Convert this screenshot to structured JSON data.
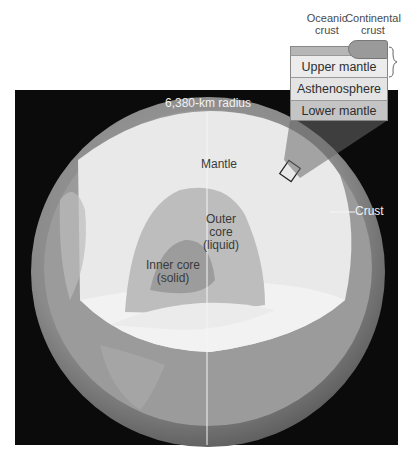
{
  "figure": {
    "radius_label": "6,380-km radius",
    "layers": {
      "mantle": "Mantle",
      "crust": "Crust",
      "outer_core": [
        "Outer",
        "core",
        "(liquid)"
      ],
      "inner_core": [
        "Inner core",
        "(solid)"
      ]
    },
    "inset": {
      "oceanic_crust": [
        "Oceanic",
        "crust"
      ],
      "continental_crust": [
        "Continental",
        "crust"
      ],
      "rows": [
        "Upper mantle",
        "Asthenosphere",
        "Lower mantle"
      ]
    },
    "colors": {
      "background": "#0b0b0b",
      "mantle": "#e8e8e8",
      "outer_core": "#bdbdbd",
      "inner_core": "#9c9c9c",
      "crust_shell": "#8a8a8a"
    }
  }
}
